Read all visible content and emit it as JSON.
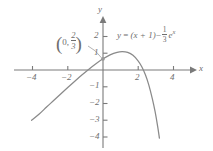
{
  "chart_data": {
    "type": "line",
    "title": "",
    "xlabel": "x",
    "ylabel": "y",
    "equation_plain": "y = (x + 1) - (1/3)e^x",
    "equation_parts": {
      "lhs": "y",
      "equals": "=",
      "linear_term": "(x + 1)",
      "minus": "−",
      "coef_num": "1",
      "coef_den": "3",
      "exp_base": "e",
      "exp_power": "x"
    },
    "xlim": [
      -5.3,
      5.6
    ],
    "ylim": [
      -4.6,
      2.5
    ],
    "grid": false,
    "legend": "none",
    "x_ticks": [
      -4,
      -2,
      2,
      4
    ],
    "x_tick_labels": [
      "−4",
      "−2",
      "2",
      "4"
    ],
    "y_ticks": [
      2,
      1,
      -1,
      -2,
      -3,
      -4
    ],
    "y_tick_labels": [
      "2",
      "1",
      "−1",
      "−2",
      "−3",
      "−4"
    ],
    "annotations": [
      {
        "name": "y-intercept",
        "text": "(0, 2/3)",
        "x_label": "0",
        "separator": ",",
        "frac_num": "2",
        "frac_den": "3",
        "point_x": 0,
        "point_y": 0.667
      }
    ],
    "curve_points": [
      [
        -4.05,
        -3.0
      ],
      [
        -3.6,
        -2.61
      ],
      [
        -3.2,
        -2.21
      ],
      [
        -2.8,
        -1.82
      ],
      [
        -2.4,
        -1.43
      ],
      [
        -2.0,
        -1.045
      ],
      [
        -1.6,
        -0.667
      ],
      [
        -1.2,
        -0.3
      ],
      [
        -0.8,
        0.05
      ],
      [
        -0.4,
        0.377
      ],
      [
        0.0,
        0.667
      ],
      [
        0.4,
        0.903
      ],
      [
        0.8,
        1.058
      ],
      [
        1.1,
        1.097
      ],
      [
        1.4,
        1.049
      ],
      [
        1.7,
        0.875
      ],
      [
        2.0,
        0.537
      ],
      [
        2.2,
        0.196
      ],
      [
        2.4,
        -0.274
      ],
      [
        2.6,
        -0.9
      ],
      [
        2.8,
        -1.72
      ],
      [
        2.95,
        -2.46
      ],
      [
        3.1,
        -3.36
      ],
      [
        3.2,
        -4.07
      ]
    ],
    "colors": {
      "curve": "#8a8a8a",
      "axis": "#7a7a7a",
      "text": "#6e6e6e",
      "background": "#ffffff"
    }
  }
}
